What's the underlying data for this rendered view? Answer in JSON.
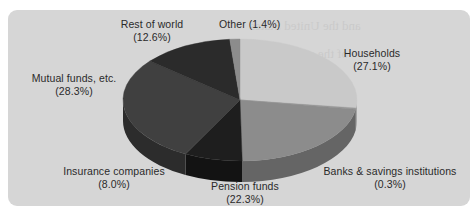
{
  "figure": {
    "panel_color": "#d6d6d6",
    "page_background": "#ffffff",
    "label_color": "#2a2a2a"
  },
  "chart_data": {
    "type": "pie",
    "title": "",
    "subtitle": "",
    "xlabel": "",
    "ylabel": "",
    "legend_position": "none",
    "grid": false,
    "style": "3d-pie",
    "start_angle_deg": 0,
    "direction": "clockwise",
    "units": "percent",
    "total": 100.0,
    "categories": [
      "Households",
      "Banks & savings institutions",
      "Pension funds",
      "Insurance companies",
      "Mutual funds, etc.",
      "Rest of world",
      "Other"
    ],
    "values": [
      27.1,
      0.3,
      22.3,
      8.0,
      28.3,
      12.6,
      1.4
    ],
    "colors": [
      "#c9c9c9",
      "#9a9a9a",
      "#8c8c8c",
      "#1e1e1e",
      "#404040",
      "#2b2b2b",
      "#8c8c8c"
    ],
    "slices": [
      {
        "label": "Households",
        "value": 27.1,
        "value_text": "(27.1%)",
        "color": "#c9c9c9",
        "side_color": "#a5a5a5"
      },
      {
        "label": "Banks & savings institutions",
        "value": 0.3,
        "value_text": "(0.3%)",
        "color": "#9a9a9a",
        "side_color": "#6e6e6e"
      },
      {
        "label": "Pension funds",
        "value": 22.3,
        "value_text": "(22.3%)",
        "color": "#8c8c8c",
        "side_color": "#656565"
      },
      {
        "label": "Insurance companies",
        "value": 8.0,
        "value_text": "(8.0%)",
        "color": "#1e1e1e",
        "side_color": "#131313"
      },
      {
        "label": "Mutual funds, etc.",
        "value": 28.3,
        "value_text": "(28.3%)",
        "color": "#404040",
        "side_color": "#2c2c2c"
      },
      {
        "label": "Rest of world",
        "value": 12.6,
        "value_text": "(12.6%)",
        "color": "#2b2b2b",
        "side_color": "#1c1c1c"
      },
      {
        "label": "Other",
        "value": 1.4,
        "value_text": "(1.4%)",
        "color": "#8c8c8c",
        "side_color": "#656565"
      }
    ]
  },
  "labels": {
    "rest_of_world": {
      "line1": "Rest of world",
      "line2": "(12.6%)"
    },
    "other": {
      "line1": "Other (1.4%)",
      "line2": ""
    },
    "households": {
      "line1": "Households",
      "line2": "(27.1%)"
    },
    "banks": {
      "line1": "Banks & savings institutions",
      "line2": "(0.3%)"
    },
    "pension_funds": {
      "line1": "Pension funds",
      "line2": "(22.3%)"
    },
    "insurance": {
      "line1": "Insurance companies",
      "line2": "(8.0%)"
    },
    "mutual_funds": {
      "line1": "Mutual funds, etc.",
      "line2": "(28.3%)"
    }
  },
  "ghost_text": [
    "and the United States",
    "of the stock market",
    "holders of all",
    "companies and",
    "in the 1990s",
    "the share of"
  ]
}
